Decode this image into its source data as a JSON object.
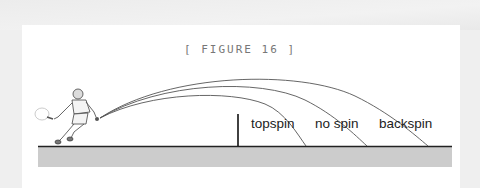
{
  "figure": {
    "caption": "[ FIGURE 16 ]",
    "labels": {
      "topspin": "topspin",
      "no_spin": "no spin",
      "backspin": "backspin"
    },
    "colors": {
      "background": "#efefef",
      "panel": "#ffffff",
      "court": "#cccccc",
      "ground_line": "#222222",
      "trajectory": "#555555"
    }
  }
}
